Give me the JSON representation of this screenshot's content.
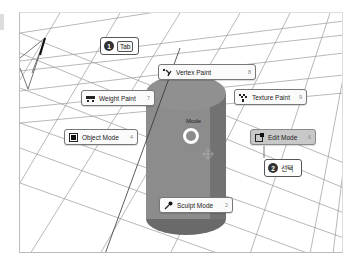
{
  "viewport": {
    "name": "3D Viewport",
    "colors": {
      "background": "#ffffff",
      "grid": "#9a9a9a",
      "object": "#8c8c8c",
      "object_dark": "#5e5e5e"
    }
  },
  "pie_menu": {
    "title": "Mode",
    "items": [
      {
        "id": "vertex-paint",
        "label": "Vertex Paint",
        "key": "8",
        "icon": "vertex-paint-icon"
      },
      {
        "id": "weight-paint",
        "label": "Weight Paint",
        "key": "7",
        "icon": "weight-paint-icon"
      },
      {
        "id": "texture-paint",
        "label": "Texture Paint",
        "key": "9",
        "icon": "texture-paint-icon"
      },
      {
        "id": "object-mode",
        "label": "Object Mode",
        "key": "4",
        "icon": "object-mode-icon"
      },
      {
        "id": "edit-mode",
        "label": "Edit Mode",
        "key": "6",
        "icon": "edit-mode-icon",
        "active": true
      },
      {
        "id": "sculpt-mode",
        "label": "Sculpt Mode",
        "key": "2",
        "icon": "sculpt-mode-icon"
      }
    ]
  },
  "callouts": [
    {
      "step": "1",
      "key": "Tab"
    },
    {
      "step": "2",
      "text": "선택"
    }
  ]
}
